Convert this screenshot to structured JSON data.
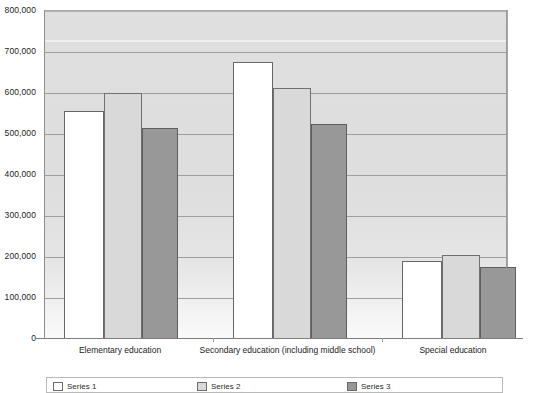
{
  "chart_data": {
    "type": "bar",
    "title": "",
    "xlabel": "",
    "ylabel": "",
    "ylim": [
      0,
      800000
    ],
    "grid": true,
    "legend_position": "bottom",
    "categories": [
      "Elementary education",
      "Secondary education (including middle school)",
      "Special education"
    ],
    "ytick_labels": [
      "800,000",
      "700,000",
      "600,000",
      "500,000",
      "400,000",
      "300,000",
      "200,000",
      "100,000",
      "0"
    ],
    "ytick_values": [
      800000,
      700000,
      600000,
      500000,
      400000,
      300000,
      200000,
      100000,
      0
    ],
    "series": [
      {
        "name": "Series 1",
        "color": "#ffffff",
        "values": [
          555000,
          675000,
          190000
        ]
      },
      {
        "name": "Series 2",
        "color": "#d9d9d9",
        "values": [
          600000,
          613000,
          205000
        ]
      },
      {
        "name": "Series 3",
        "color": "#989898",
        "values": [
          515000,
          525000,
          175000
        ]
      }
    ]
  },
  "axis": {
    "zero_label": "0"
  }
}
